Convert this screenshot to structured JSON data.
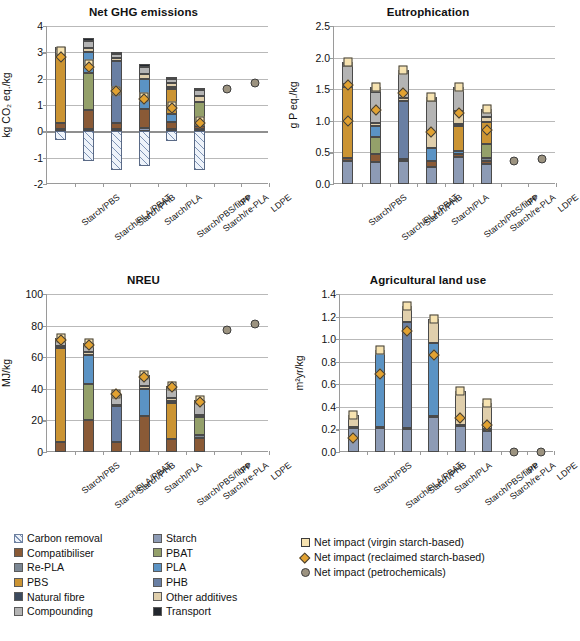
{
  "figure": {
    "legend_series": [
      {
        "label": "Carbon removal",
        "color": "#dce8f5",
        "hatched": true
      },
      {
        "label": "Starch",
        "color": "#8d9bb5",
        "hatched": false
      },
      {
        "label": "Compatibiliser",
        "color": "#8a5a36",
        "hatched": false
      },
      {
        "label": "PBAT",
        "color": "#94a06a",
        "hatched": false
      },
      {
        "label": "Re-PLA",
        "color": "#7b8794",
        "hatched": false
      },
      {
        "label": "PLA",
        "color": "#5b93c4",
        "hatched": false
      },
      {
        "label": "PBS",
        "color": "#cb9433",
        "hatched": false
      },
      {
        "label": "PHB",
        "color": "#697fa3",
        "hatched": false
      },
      {
        "label": "Natural fibre",
        "color": "#3c4a5e",
        "hatched": false
      },
      {
        "label": "Other additives",
        "color": "#e0cfac",
        "hatched": false
      },
      {
        "label": "Compounding",
        "color": "#b4b4b4",
        "hatched": false
      },
      {
        "label": "Transport",
        "color": "#22272e",
        "hatched": false
      }
    ],
    "legend_markers": [
      {
        "label": "Net impact (virgin starch-based)",
        "shape": "square",
        "color": "#f7e3b0"
      },
      {
        "label": "Net impact (reclaimed starch-based)",
        "shape": "diamond",
        "color": "#e2a231"
      },
      {
        "label": "Net impact (petrochemicals)",
        "shape": "circle",
        "color": "#9c9380"
      }
    ]
  },
  "chart_data": [
    {
      "type": "bar",
      "title": "Net GHG emissions",
      "ylabel": "kg CO₂ eq./kg",
      "xlabel": "",
      "ylim": [
        -2,
        4
      ],
      "yticks": [
        -2,
        -1,
        0,
        1,
        2,
        3,
        4
      ],
      "ytick_labels": [
        "-2",
        "-1",
        "0",
        "1",
        "2",
        "3",
        "4"
      ],
      "grid": true,
      "categories": [
        "Starch/PBS",
        "Starch/PLA/PBAT",
        "Starch/PHB",
        "Starch/PLA",
        "Starch/PBS/fibre",
        "Starch/re-PLA",
        "PP",
        "LDPE"
      ],
      "series": [
        {
          "name": "Starch",
          "values": [
            0.1,
            0.1,
            0.1,
            0.12,
            0.1,
            0.08,
            null,
            null
          ]
        },
        {
          "name": "Compatibiliser",
          "values": [
            0.2,
            0.72,
            0.2,
            0.72,
            0.25,
            0.12,
            null,
            null
          ]
        },
        {
          "name": "Re-PLA",
          "values": [
            0,
            0,
            0,
            0,
            0,
            0.15,
            null,
            null
          ]
        },
        {
          "name": "PBAT",
          "values": [
            0,
            1.38,
            0,
            0,
            0,
            0.78,
            null,
            null
          ]
        },
        {
          "name": "PLA",
          "values": [
            0,
            0.8,
            0,
            1.15,
            0.3,
            0,
            null,
            null
          ]
        },
        {
          "name": "PBS",
          "values": [
            2.55,
            0,
            0,
            0,
            0.95,
            0,
            null,
            null
          ]
        },
        {
          "name": "PHB",
          "values": [
            0,
            0,
            2.38,
            0,
            0,
            0,
            null,
            null
          ]
        },
        {
          "name": "Natural fibre",
          "values": [
            0,
            0,
            0,
            0,
            0.1,
            0,
            null,
            null
          ]
        },
        {
          "name": "Other additives",
          "values": [
            0.1,
            0.15,
            0.1,
            0.2,
            0.15,
            0.2,
            null,
            null
          ]
        },
        {
          "name": "Compounding",
          "values": [
            0.18,
            0.28,
            0.15,
            0.25,
            0.15,
            0.25,
            null,
            null
          ]
        },
        {
          "name": "Transport",
          "values": [
            0.08,
            0.12,
            0.08,
            0.1,
            0.08,
            0.08,
            null,
            null
          ]
        }
      ],
      "carbon_removal": [
        -0.33,
        -1.12,
        -1.45,
        -1.3,
        -0.35,
        -1.48,
        null,
        null
      ],
      "markers": {
        "virgin": [
          3.05,
          2.55,
          1.55,
          1.3,
          0.95,
          0.38,
          null,
          null
        ],
        "reclaimed": [
          2.82,
          2.45,
          1.52,
          1.22,
          0.88,
          0.3,
          null,
          null
        ],
        "petrochemical": [
          null,
          null,
          null,
          null,
          null,
          null,
          1.62,
          1.85
        ]
      }
    },
    {
      "type": "bar",
      "title": "Eutrophication",
      "ylabel": "g P eq./kg",
      "xlabel": "",
      "ylim": [
        0,
        2.5
      ],
      "yticks": [
        0,
        0.5,
        1.0,
        1.5,
        2.0,
        2.5
      ],
      "ytick_labels": [
        "0.0",
        "0.5",
        "1.0",
        "1.5",
        "2.0",
        "2.5"
      ],
      "grid": true,
      "categories": [
        "Starch/PBS",
        "Starch/PLA/PBAT",
        "Starch/PHB",
        "Starch/PLA",
        "Starch/PBS/fibre",
        "Starch/re-PLA",
        "PP",
        "LDPE"
      ],
      "series": [
        {
          "name": "Starch",
          "values": [
            0.37,
            0.35,
            0.36,
            0.27,
            0.42,
            0.32,
            null,
            null
          ]
        },
        {
          "name": "Compatibiliser",
          "values": [
            0.04,
            0.12,
            0.03,
            0.1,
            0.05,
            0.04,
            null,
            null
          ]
        },
        {
          "name": "Re-PLA",
          "values": [
            0,
            0,
            0,
            0,
            0,
            0.05,
            null,
            null
          ]
        },
        {
          "name": "PBAT",
          "values": [
            0,
            0.28,
            0,
            0,
            0,
            0.22,
            null,
            null
          ]
        },
        {
          "name": "PLA",
          "values": [
            0,
            0.17,
            0,
            0.2,
            0.05,
            0,
            null,
            null
          ]
        },
        {
          "name": "PBS",
          "values": [
            1.13,
            0,
            0,
            0,
            0.4,
            0.35,
            null,
            null
          ]
        },
        {
          "name": "PHB",
          "values": [
            0,
            0,
            0.92,
            0,
            0,
            0,
            null,
            null
          ]
        },
        {
          "name": "Natural fibre",
          "values": [
            0,
            0,
            0,
            0,
            0.03,
            0,
            null,
            null
          ]
        },
        {
          "name": "Other additives",
          "values": [
            0.05,
            0.05,
            0.05,
            0.25,
            0.2,
            0.08,
            null,
            null
          ]
        },
        {
          "name": "Compounding",
          "values": [
            0.28,
            0.48,
            0.4,
            0.5,
            0.35,
            0.1,
            null,
            null
          ]
        },
        {
          "name": "Transport",
          "values": [
            0.06,
            0.08,
            0.05,
            0.05,
            0.03,
            0.03,
            null,
            null
          ]
        }
      ],
      "carbon_removal": [
        null,
        null,
        null,
        null,
        null,
        null,
        null,
        null
      ],
      "markers": {
        "virgin": [
          1.93,
          1.53,
          1.8,
          1.37,
          1.53,
          1.19,
          null,
          null
        ],
        "reclaimed": [
          1.57,
          1.17,
          1.44,
          0.83,
          1.12,
          0.85,
          null,
          null
        ],
        "reclaimed2": [
          1.0,
          null,
          null,
          null,
          null,
          null,
          null,
          null
        ],
        "petrochemical": [
          null,
          null,
          null,
          null,
          null,
          null,
          0.37,
          0.39
        ]
      }
    },
    {
      "type": "bar",
      "title": "NREU",
      "ylabel": "MJ/kg",
      "xlabel": "",
      "ylim": [
        0,
        100
      ],
      "yticks": [
        0,
        20,
        40,
        60,
        80,
        100
      ],
      "ytick_labels": [
        "0",
        "20",
        "40",
        "60",
        "80",
        "100"
      ],
      "grid": true,
      "categories": [
        "Starch/PBS",
        "Starch/PLA/PBAT",
        "Starch/PHB",
        "Starch/PLA",
        "Starch/PBS/fibre",
        "Starch/re-PLA",
        "PP",
        "LDPE"
      ],
      "series": [
        {
          "name": "Starch",
          "values": [
            0,
            0,
            0,
            0,
            0,
            0,
            null,
            null
          ]
        },
        {
          "name": "Compatibiliser",
          "values": [
            6.5,
            20.0,
            6.5,
            23.0,
            8.0,
            9.0,
            null,
            null
          ]
        },
        {
          "name": "Re-PLA",
          "values": [
            0,
            0,
            0,
            0,
            0,
            2.0,
            null,
            null
          ]
        },
        {
          "name": "PBAT",
          "values": [
            0,
            23.0,
            0,
            0,
            0,
            11.0,
            null,
            null
          ]
        },
        {
          "name": "PLA",
          "values": [
            0,
            18.5,
            0,
            17.0,
            0,
            0,
            null,
            null
          ]
        },
        {
          "name": "PBS",
          "values": [
            59.5,
            0,
            0,
            0,
            23.0,
            0,
            null,
            null
          ]
        },
        {
          "name": "PHB",
          "values": [
            0,
            0,
            22.5,
            0,
            0,
            0,
            null,
            null
          ]
        },
        {
          "name": "Natural fibre",
          "values": [
            0,
            0,
            0,
            0,
            1.5,
            0,
            null,
            null
          ]
        },
        {
          "name": "Other additives",
          "values": [
            1.0,
            1.5,
            1.0,
            1.5,
            1.5,
            1.5,
            null,
            null
          ]
        },
        {
          "name": "Compounding",
          "values": [
            4.0,
            5.0,
            6.0,
            6.0,
            6.5,
            8.5,
            null,
            null
          ]
        },
        {
          "name": "Transport",
          "values": [
            1.0,
            1.0,
            1.0,
            1.0,
            1.0,
            1.0,
            null,
            null
          ]
        }
      ],
      "carbon_removal": [
        null,
        null,
        null,
        null,
        null,
        null,
        null,
        null
      ],
      "markers": {
        "virgin": [
          72.0,
          69.0,
          37.0,
          49.0,
          41.5,
          33.0,
          null,
          null
        ],
        "reclaimed": [
          71.0,
          67.5,
          36.5,
          47.5,
          41.0,
          31.5,
          null,
          null
        ],
        "petrochemical": [
          null,
          null,
          null,
          null,
          null,
          null,
          77.0,
          81.0
        ]
      }
    },
    {
      "type": "bar",
      "title": "Agricultural land use",
      "ylabel": "m²yr/kg",
      "xlabel": "",
      "ylim": [
        0,
        1.4
      ],
      "yticks": [
        0,
        0.2,
        0.4,
        0.6,
        0.8,
        1.0,
        1.2,
        1.4
      ],
      "ytick_labels": [
        "0.0",
        "0.2",
        "0.4",
        "0.6",
        "0.8",
        "1.0",
        "1.2",
        "1.4"
      ],
      "grid": true,
      "categories": [
        "Starch/PBS",
        "Starch/PLA/PBAT",
        "Starch/PHB",
        "Starch/PLA",
        "Starch/PBS/fibre",
        "Starch/re-PLA",
        "PP",
        "LDPE"
      ],
      "series": [
        {
          "name": "Starch",
          "values": [
            0.21,
            0.21,
            0.2,
            0.31,
            0.23,
            0.19,
            null,
            null
          ]
        },
        {
          "name": "Compatibiliser",
          "values": [
            0.01,
            0.01,
            0.01,
            0.01,
            0.01,
            0.01,
            null,
            null
          ]
        },
        {
          "name": "Re-PLA",
          "values": [
            0,
            0,
            0,
            0,
            0,
            0,
            null,
            null
          ]
        },
        {
          "name": "PBAT",
          "values": [
            0,
            0,
            0,
            0,
            0,
            0,
            null,
            null
          ]
        },
        {
          "name": "PLA",
          "values": [
            0,
            0.67,
            0,
            0.65,
            0,
            0,
            null,
            null
          ]
        },
        {
          "name": "PBS",
          "values": [
            0,
            0,
            0,
            0,
            0,
            0,
            null,
            null
          ]
        },
        {
          "name": "PHB",
          "values": [
            0,
            0,
            0.94,
            0,
            0,
            0,
            null,
            null
          ]
        },
        {
          "name": "Natural fibre",
          "values": [
            0,
            0,
            0,
            0,
            0,
            0,
            null,
            null
          ]
        },
        {
          "name": "Other additives",
          "values": [
            0.11,
            0.01,
            0.14,
            0.21,
            0.3,
            0.23,
            null,
            null
          ]
        },
        {
          "name": "Compounding",
          "values": [
            0,
            0,
            0,
            0,
            0,
            0,
            null,
            null
          ]
        },
        {
          "name": "Transport",
          "values": [
            0,
            0,
            0,
            0,
            0,
            0,
            null,
            null
          ]
        }
      ],
      "carbon_removal": [
        null,
        null,
        null,
        null,
        null,
        null,
        null,
        null
      ],
      "markers": {
        "virgin": [
          0.33,
          0.9,
          1.29,
          1.18,
          0.54,
          0.43,
          null,
          null
        ],
        "reclaimed": [
          0.12,
          0.69,
          1.07,
          0.86,
          0.3,
          0.24,
          null,
          null
        ],
        "petrochemical": [
          null,
          null,
          null,
          null,
          null,
          null,
          0.0,
          0.0
        ]
      }
    }
  ]
}
